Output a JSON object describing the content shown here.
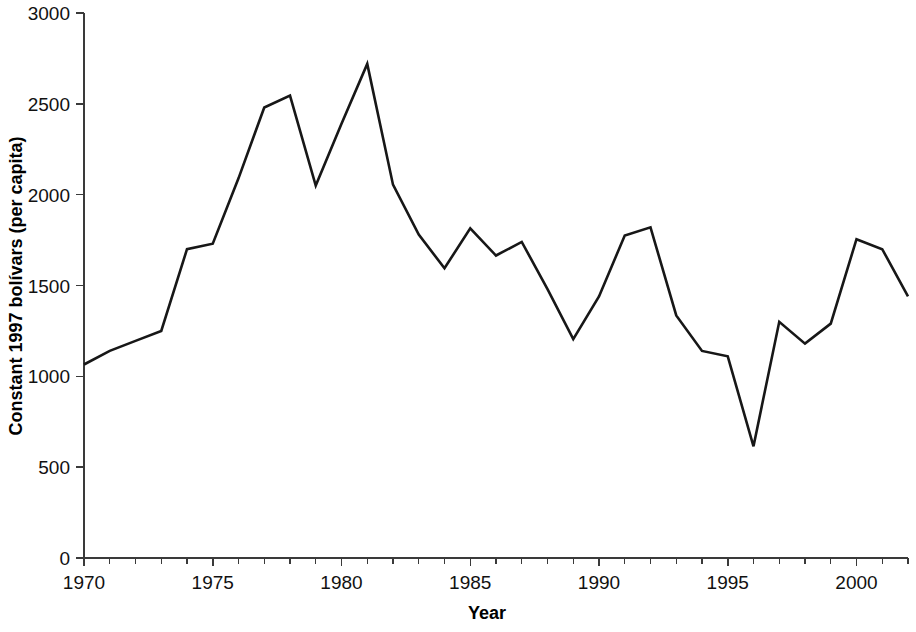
{
  "chart_data": {
    "type": "line",
    "title": "",
    "subtitle": "",
    "xlabel": "Year",
    "ylabel": "Constant 1997 bolívars (per capita)",
    "xlim": [
      1970,
      2002
    ],
    "ylim": [
      0,
      3000
    ],
    "grid": false,
    "legend": "none",
    "line_color": "#171717",
    "x_ticks_major": [
      1970,
      1975,
      1980,
      1985,
      1990,
      1995,
      2000
    ],
    "x_tick_labels": [
      "1970",
      "1975",
      "1980",
      "1985",
      "1990",
      "1995",
      "2000"
    ],
    "x_tick_minor_step": 1,
    "y_ticks": [
      0,
      500,
      1000,
      1500,
      2000,
      2500,
      3000
    ],
    "y_tick_labels": [
      "0",
      "500",
      "1000",
      "1500",
      "2000",
      "2500",
      "3000"
    ],
    "x": [
      1970,
      1971,
      1972,
      1973,
      1974,
      1975,
      1976,
      1977,
      1978,
      1979,
      1980,
      1981,
      1982,
      1983,
      1984,
      1985,
      1986,
      1987,
      1988,
      1989,
      1990,
      1991,
      1992,
      1993,
      1994,
      1995,
      1996,
      1997,
      1998,
      1999,
      2000,
      2001,
      2002
    ],
    "values": [
      1065,
      1140,
      1195,
      1250,
      1700,
      1730,
      2090,
      2480,
      2545,
      2050,
      2390,
      2720,
      2055,
      1780,
      1595,
      1815,
      1665,
      1740,
      1480,
      1205,
      1440,
      1775,
      1820,
      1335,
      1140,
      1110,
      615,
      1300,
      1180,
      1290,
      1755,
      1700,
      1440
    ],
    "series": [
      {
        "name": "Constant 1997 bolívars (per capita)",
        "values": [
          1065,
          1140,
          1195,
          1250,
          1700,
          1730,
          2090,
          2480,
          2545,
          2050,
          2390,
          2720,
          2055,
          1780,
          1595,
          1815,
          1665,
          1740,
          1480,
          1205,
          1440,
          1775,
          1820,
          1335,
          1140,
          1110,
          615,
          1300,
          1180,
          1290,
          1755,
          1700,
          1440
        ]
      }
    ]
  }
}
